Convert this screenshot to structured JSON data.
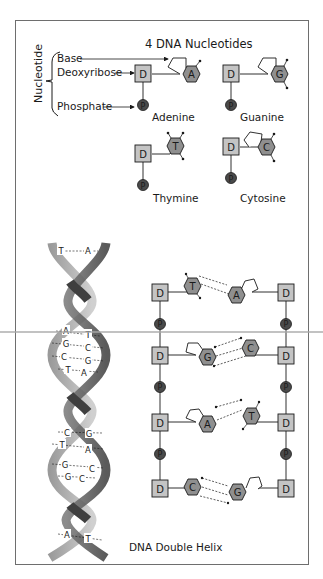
{
  "title": "4 DNA Nucleotides",
  "legend": {
    "group_label": "Nucleotide",
    "base": "Base",
    "deoxyribose": "Deoxyribose",
    "phosphate": "Phosphate"
  },
  "symbols": {
    "sugar": "D",
    "phosphate": "P"
  },
  "nucleotides": [
    {
      "letter": "A",
      "name": "Adenine"
    },
    {
      "letter": "G",
      "name": "Guanine"
    },
    {
      "letter": "T",
      "name": "Thymine"
    },
    {
      "letter": "C",
      "name": "Cytosine"
    }
  ],
  "helix": {
    "caption": "DNA Double Helix",
    "pairs": [
      {
        "left": "T",
        "right": "A"
      },
      {
        "left": "A",
        "right": "T"
      },
      {
        "left": "G",
        "right": "C"
      },
      {
        "left": "C",
        "right": "G"
      },
      {
        "left": "T",
        "right": "A"
      },
      {
        "left": "C",
        "right": "G"
      },
      {
        "left": "T",
        "right": "A"
      },
      {
        "left": "G",
        "right": "C"
      },
      {
        "left": "G",
        "right": "C"
      },
      {
        "left": "A",
        "right": "T"
      }
    ]
  },
  "ladder": {
    "rungs": [
      {
        "left": "T",
        "right": "A"
      },
      {
        "left": "G",
        "right": "C"
      },
      {
        "left": "A",
        "right": "T"
      },
      {
        "left": "C",
        "right": "G"
      }
    ]
  },
  "colors": {
    "sugar_fill": "#c4c4c4",
    "base_fill": "#8f8f8f",
    "phosphate_fill": "#4a4a4a",
    "strand_light": "#bdbdbd",
    "strand_dark": "#5a5a5a",
    "frame": "#6e6e6e"
  }
}
